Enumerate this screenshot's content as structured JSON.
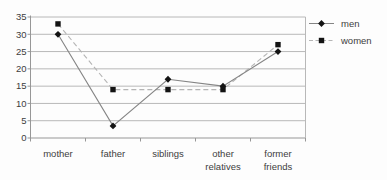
{
  "chart_data": {
    "type": "line",
    "title": "",
    "xlabel": "",
    "ylabel": "",
    "categories": [
      "mother",
      "father",
      "siblings",
      "other relatives",
      "former friends"
    ],
    "series": [
      {
        "name": "men",
        "marker": "diamond",
        "line_style": "solid",
        "line_color": "#858585",
        "marker_color": "#131313",
        "values": [
          30,
          3.5,
          17,
          15,
          25
        ]
      },
      {
        "name": "women",
        "marker": "square",
        "line_style": "dashed",
        "line_color": "#b5b5b5",
        "marker_color": "#131313",
        "values": [
          33,
          14,
          14,
          14,
          27
        ]
      }
    ],
    "ylim": [
      0,
      35
    ],
    "yticks": [
      0,
      5,
      10,
      15,
      20,
      25,
      30,
      35
    ],
    "grid": "horizontal",
    "legend_position": "right"
  },
  "colors": {
    "background": "#fdfdfd",
    "grid_line": "#b8b8b8",
    "axis_line": "#979797",
    "text": "#3d3d3d"
  }
}
